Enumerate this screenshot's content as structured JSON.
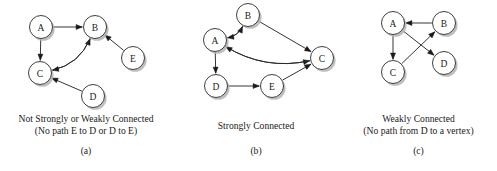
{
  "figure": {
    "background_color": "#ffffff",
    "ink_color": "#1a1a1a",
    "node_fill": "#ffffff",
    "shadow_color": "#b4b4b4"
  },
  "panels": [
    {
      "id": "a",
      "letter": "(a)",
      "caption_line1": "Not Strongly or Weakly Connected",
      "caption_line2": "(No path E to D or D to E)",
      "nodes": [
        {
          "id": "A",
          "label": "A",
          "cx": 41,
          "cy": 27,
          "r": 11.5
        },
        {
          "id": "B",
          "label": "B",
          "cx": 95,
          "cy": 27,
          "r": 11.5
        },
        {
          "id": "C",
          "label": "C",
          "cx": 40,
          "cy": 73,
          "r": 11.5
        },
        {
          "id": "D",
          "label": "D",
          "cx": 93,
          "cy": 96,
          "r": 11.5
        },
        {
          "id": "E",
          "label": "E",
          "cx": 133,
          "cy": 58,
          "r": 11.5
        }
      ],
      "edges": [
        {
          "from": "A",
          "to": "B",
          "style": "straight"
        },
        {
          "from": "A",
          "to": "C",
          "style": "straight"
        },
        {
          "from": "C",
          "to": "B",
          "style": "curved"
        },
        {
          "from": "B",
          "to": "C",
          "style": "curved"
        },
        {
          "from": "D",
          "to": "C",
          "style": "straight"
        },
        {
          "from": "E",
          "to": "B",
          "style": "straight"
        }
      ]
    },
    {
      "id": "b",
      "letter": "(b)",
      "caption_line1": "Strongly Connected",
      "caption_line2": "",
      "nodes": [
        {
          "id": "A",
          "label": "A",
          "cx": 43,
          "cy": 40,
          "r": 11.5
        },
        {
          "id": "B",
          "label": "B",
          "cx": 76,
          "cy": 15,
          "r": 11.5
        },
        {
          "id": "C",
          "label": "C",
          "cx": 150,
          "cy": 58,
          "r": 11.5
        },
        {
          "id": "D",
          "label": "D",
          "cx": 44,
          "cy": 86,
          "r": 11.5
        },
        {
          "id": "E",
          "label": "E",
          "cx": 100,
          "cy": 86,
          "r": 11.5
        }
      ],
      "edges": [
        {
          "from": "A",
          "to": "B",
          "style": "curved"
        },
        {
          "from": "B",
          "to": "A",
          "style": "curved"
        },
        {
          "from": "B",
          "to": "C",
          "style": "straight"
        },
        {
          "from": "A",
          "to": "C",
          "style": "curved"
        },
        {
          "from": "C",
          "to": "A",
          "style": "curved"
        },
        {
          "from": "A",
          "to": "D",
          "style": "straight"
        },
        {
          "from": "D",
          "to": "E",
          "style": "straight"
        },
        {
          "from": "E",
          "to": "C",
          "style": "straight"
        }
      ]
    },
    {
      "id": "c",
      "letter": "(c)",
      "caption_line1": "Weakly Connected",
      "caption_line2": "(No path from D to a vertex)",
      "nodes": [
        {
          "id": "A",
          "label": "A",
          "cx": 53,
          "cy": 23,
          "r": 11.5
        },
        {
          "id": "B",
          "label": "B",
          "cx": 104,
          "cy": 23,
          "r": 11.5
        },
        {
          "id": "C",
          "label": "C",
          "cx": 53,
          "cy": 72,
          "r": 11.5
        },
        {
          "id": "D",
          "label": "D",
          "cx": 104,
          "cy": 63,
          "r": 11.5
        }
      ],
      "edges": [
        {
          "from": "B",
          "to": "A",
          "style": "straight"
        },
        {
          "from": "A",
          "to": "C",
          "style": "straight"
        },
        {
          "from": "A",
          "to": "D",
          "style": "straight"
        },
        {
          "from": "C",
          "to": "B",
          "style": "straight"
        }
      ]
    }
  ]
}
